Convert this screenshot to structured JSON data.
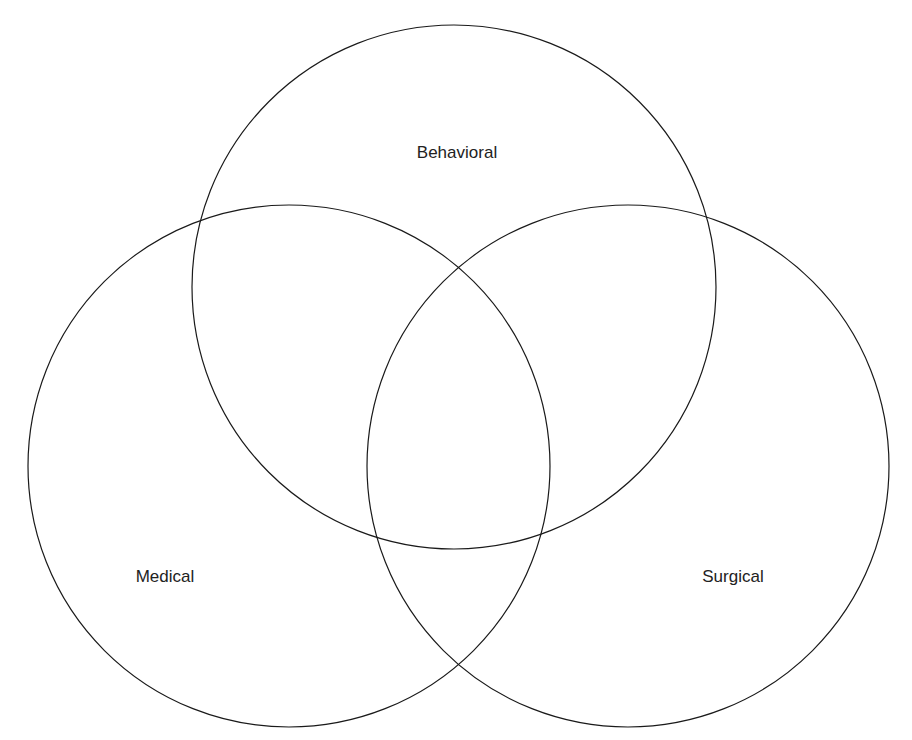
{
  "diagram": {
    "type": "venn",
    "sets": [
      {
        "id": "behavioral",
        "label": "Behavioral",
        "cx": 454,
        "cy": 287,
        "r": 262,
        "label_x": 457,
        "label_y": 158
      },
      {
        "id": "medical",
        "label": "Medical",
        "cx": 289,
        "cy": 466,
        "r": 261,
        "label_x": 165,
        "label_y": 582
      },
      {
        "id": "surgical",
        "label": "Surgical",
        "cx": 628,
        "cy": 466,
        "r": 261,
        "label_x": 733,
        "label_y": 582
      }
    ],
    "stroke_color": "#1a1a1a",
    "background": "#ffffff"
  }
}
